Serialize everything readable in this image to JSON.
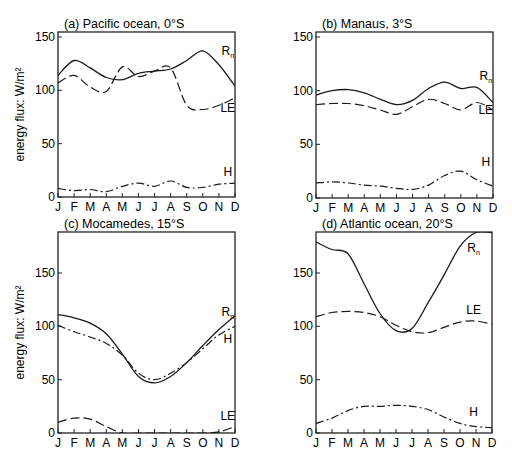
{
  "figure": {
    "ylabel": "energy flux: W/m²",
    "months": [
      "J",
      "F",
      "M",
      "A",
      "M",
      "J",
      "J",
      "A",
      "S",
      "O",
      "N",
      "D"
    ]
  },
  "chart_data": [
    {
      "type": "line",
      "title": "(a) Pacific ocean, 0°S",
      "xlabel": "",
      "ylabel": "energy flux: W/m²",
      "categories": [
        "J",
        "F",
        "M",
        "A",
        "M",
        "J",
        "J",
        "A",
        "S",
        "O",
        "N",
        "D"
      ],
      "ylim": [
        0,
        150
      ],
      "yticks": [
        0,
        50,
        100,
        150
      ],
      "grid": false,
      "series": [
        {
          "name": "Rn",
          "style": "solid",
          "values": [
            114,
            128,
            121,
            112,
            110,
            116,
            118,
            120,
            128,
            137,
            124,
            104
          ]
        },
        {
          "name": "LE",
          "style": "dashed",
          "values": [
            107,
            114,
            103,
            99,
            122,
            113,
            118,
            121,
            86,
            82,
            86,
            93
          ]
        },
        {
          "name": "H",
          "style": "dashdot",
          "values": [
            8,
            6,
            7,
            5,
            10,
            13,
            10,
            15,
            9,
            9,
            12,
            13
          ]
        }
      ],
      "labels": [
        {
          "text": "R",
          "sub": "n",
          "at": [
            10.8,
            133
          ]
        },
        {
          "text": "LE",
          "sub": "",
          "at": [
            10.8,
            80
          ]
        },
        {
          "text": "H",
          "sub": "",
          "at": [
            10.8,
            20
          ]
        }
      ]
    },
    {
      "type": "line",
      "title": "(b) Manaus, 3°S",
      "xlabel": "",
      "ylabel": "",
      "categories": [
        "J",
        "F",
        "M",
        "A",
        "M",
        "J",
        "J",
        "A",
        "S",
        "O",
        "N",
        "D"
      ],
      "ylim": [
        0,
        150
      ],
      "yticks": [
        0,
        50,
        100,
        150
      ],
      "grid": false,
      "series": [
        {
          "name": "Rn",
          "style": "solid",
          "values": [
            96,
            100,
            101,
            98,
            92,
            87,
            91,
            102,
            108,
            102,
            103,
            89
          ]
        },
        {
          "name": "LE",
          "style": "dashed",
          "values": [
            87,
            88,
            88,
            86,
            82,
            78,
            85,
            92,
            88,
            82,
            89,
            82
          ]
        },
        {
          "name": "H",
          "style": "dashdot",
          "values": [
            14,
            15,
            14,
            12,
            11,
            9,
            8,
            12,
            21,
            25,
            17,
            11
          ]
        }
      ],
      "labels": [
        {
          "text": "R",
          "sub": "n",
          "at": [
            10.8,
            110
          ]
        },
        {
          "text": "LE",
          "sub": "",
          "at": [
            10.8,
            78
          ]
        },
        {
          "text": "H",
          "sub": "",
          "at": [
            10.8,
            30
          ]
        }
      ]
    },
    {
      "type": "line",
      "title": "(c) Mocamedes, 15°S",
      "xlabel": "",
      "ylabel": "energy flux: W/m²",
      "categories": [
        "J",
        "F",
        "M",
        "A",
        "M",
        "J",
        "J",
        "A",
        "S",
        "O",
        "N",
        "D"
      ],
      "ylim": [
        0,
        188
      ],
      "yticks": [
        0,
        50,
        100,
        150
      ],
      "grid": false,
      "series": [
        {
          "name": "Rn",
          "style": "solid",
          "values": [
            111,
            108,
            103,
            93,
            74,
            53,
            47,
            53,
            66,
            82,
            97,
            110
          ]
        },
        {
          "name": "H",
          "style": "dashdot",
          "values": [
            101,
            95,
            90,
            84,
            73,
            56,
            50,
            56,
            66,
            79,
            92,
            100
          ]
        },
        {
          "name": "LE",
          "style": "dashed",
          "values": [
            10,
            14,
            13,
            6,
            0,
            0,
            0,
            0,
            0,
            0,
            1,
            6
          ]
        }
      ],
      "labels": [
        {
          "text": "R",
          "sub": "n",
          "at": [
            10.8,
            110
          ]
        },
        {
          "text": "H",
          "sub": "",
          "at": [
            10.8,
            84
          ]
        },
        {
          "text": "LE",
          "sub": "",
          "at": [
            10.8,
            12
          ]
        }
      ]
    },
    {
      "type": "line",
      "title": "(d) Atlantic ocean, 20°S",
      "xlabel": "",
      "ylabel": "",
      "categories": [
        "J",
        "F",
        "M",
        "A",
        "M",
        "J",
        "J",
        "A",
        "S",
        "O",
        "N",
        "D"
      ],
      "ylim": [
        0,
        188
      ],
      "yticks": [
        0,
        50,
        100,
        150
      ],
      "grid": false,
      "series": [
        {
          "name": "Rn",
          "style": "solid",
          "values": [
            179,
            172,
            168,
            140,
            112,
            96,
            98,
            122,
            148,
            175,
            188,
            188
          ]
        },
        {
          "name": "LE",
          "style": "dashed",
          "values": [
            109,
            113,
            114,
            113,
            109,
            101,
            95,
            94,
            99,
            104,
            105,
            102
          ]
        },
        {
          "name": "H",
          "style": "dashdot",
          "values": [
            9,
            14,
            21,
            25,
            25,
            26,
            25,
            22,
            15,
            9,
            6,
            5
          ]
        }
      ],
      "labels": [
        {
          "text": "R",
          "sub": "n",
          "at": [
            10.1,
            170
          ]
        },
        {
          "text": "LE",
          "sub": "",
          "at": [
            10.1,
            112
          ]
        },
        {
          "text": "H",
          "sub": "",
          "at": [
            10.1,
            16
          ]
        }
      ]
    }
  ]
}
